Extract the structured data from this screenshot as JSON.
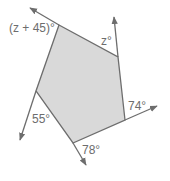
{
  "figure": {
    "type": "polygon-exterior-angles",
    "shape": "pentagon",
    "fill_color": "#d9d9d9",
    "stroke_color": "#6d6d6d",
    "vertices": [
      {
        "id": "A",
        "x": 59,
        "y": 25
      },
      {
        "id": "B",
        "x": 118,
        "y": 57
      },
      {
        "id": "C",
        "x": 125,
        "y": 120
      },
      {
        "id": "D",
        "x": 73,
        "y": 143
      },
      {
        "id": "E",
        "x": 36,
        "y": 91
      }
    ],
    "rays": [
      {
        "from": "A",
        "to_x": 30,
        "to_y": 8
      },
      {
        "from": "B",
        "to_x": 114,
        "to_y": 17
      },
      {
        "from": "C",
        "to_x": 157,
        "to_y": 106
      },
      {
        "from": "D",
        "to_x": 86,
        "to_y": 165
      },
      {
        "from": "E",
        "to_x": 20,
        "to_y": 140
      }
    ],
    "exterior_angles": [
      {
        "vertex": "A",
        "label": "(z + 45)°"
      },
      {
        "vertex": "B",
        "label": "z°"
      },
      {
        "vertex": "C",
        "label": "74°"
      },
      {
        "vertex": "D",
        "label": "78°"
      },
      {
        "vertex": "E",
        "label": "55°"
      }
    ]
  }
}
